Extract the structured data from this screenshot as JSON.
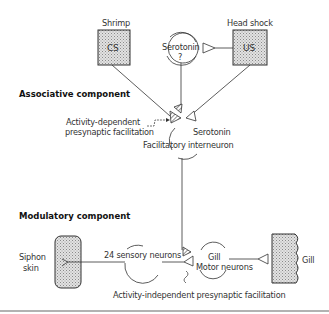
{
  "associative": {
    "title": "Associative component",
    "cs_stimulus": "Shrimp",
    "cs_box": "CS",
    "us_stimulus": "Head shock",
    "us_box": "US",
    "serotonin_neuron_line1": "Serotonin",
    "serotonin_neuron_line2": "?",
    "activity_dependent_line1": "Activity-dependent",
    "activity_dependent_line2": "presynaptic facilitation",
    "serotonin_label": "Serotonin",
    "interneuron_label": "Facilitatory interneuron"
  },
  "modulatory": {
    "title": "Modulatory component",
    "siphon_line1": "Siphon",
    "siphon_line2": "skin",
    "sensory_neurons": "24 sensory neurons",
    "motor_line1": "Gill",
    "motor_line2": "Motor neurons",
    "gill_label": "Gill",
    "activity_independent": "Activity-independent presynaptic facilitation"
  },
  "colors": {
    "line": "#333333",
    "box_fill": "#c8c8c8"
  }
}
